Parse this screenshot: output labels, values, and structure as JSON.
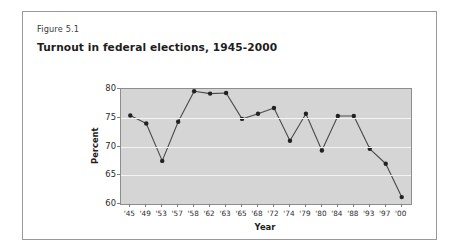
{
  "figure": {
    "label": "Figure 5.1",
    "title": "Turnout in federal elections, 1945-2000"
  },
  "chart_data": {
    "type": "line",
    "title": "Turnout in federal elections, 1945-2000",
    "xlabel": "Year",
    "ylabel": "Percent",
    "categories": [
      "'45",
      "'49",
      "'53",
      "'57",
      "'58",
      "'62",
      "'63",
      "'65",
      "'68",
      "'72",
      "'74",
      "'79",
      "'80",
      "'84",
      "'88",
      "'93",
      "'97",
      "'00"
    ],
    "values": [
      75.4,
      74.0,
      67.5,
      74.3,
      79.6,
      79.2,
      79.3,
      74.8,
      75.7,
      76.7,
      71.0,
      75.7,
      69.3,
      75.3,
      75.3,
      69.6,
      67.0,
      61.2
    ],
    "ylim": [
      60,
      80
    ],
    "yticks": [
      60,
      65,
      70,
      75,
      80
    ],
    "ytick_labels": [
      "60",
      "65",
      "70",
      "75",
      "80"
    ],
    "grid": true,
    "legend": "none",
    "marker": "filled-circle",
    "colors": {
      "plot_background": "#d5d5d5",
      "gridline": "#f4f4f4",
      "line": "#4a4a4a",
      "marker": "#222222",
      "axis": "#8d8d8d",
      "text": "#1d1d1d"
    }
  }
}
